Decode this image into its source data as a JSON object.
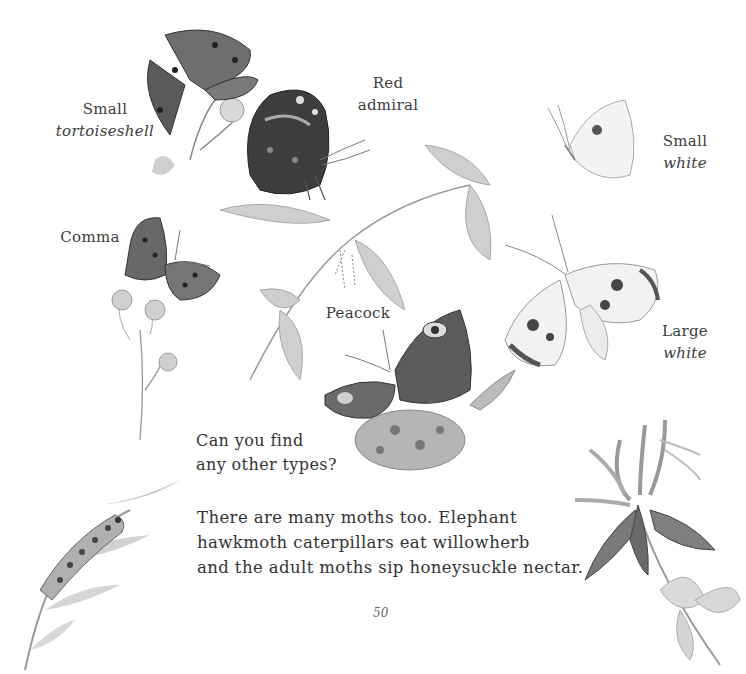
{
  "page": {
    "number": "50",
    "background": "#ffffff",
    "ink_color": "#3a3a3a"
  },
  "labels": {
    "small_tortoiseshell": {
      "line1": "Small",
      "line2": "tortoiseshell"
    },
    "red_admiral": {
      "line1": "Red",
      "line2": "admiral"
    },
    "small_white": {
      "line1": "Small",
      "line2": "white"
    },
    "comma": {
      "line1": "Comma"
    },
    "peacock": {
      "line1": "Peacock"
    },
    "large_white": {
      "line1": "Large",
      "line2": "white"
    }
  },
  "question": {
    "line1": "Can you find",
    "line2": "any other types?"
  },
  "paragraph": {
    "line1": "There are many moths too. Elephant",
    "line2": "hawkmoth caterpillars eat willowherb",
    "line3": "and the adult moths sip honeysuckle nectar."
  },
  "illustrations": [
    {
      "name": "small-tortoiseshell-butterfly-icon",
      "subject": "Small tortoiseshell on flower"
    },
    {
      "name": "red-admiral-butterfly-icon",
      "subject": "Red admiral on nettle"
    },
    {
      "name": "small-white-butterfly-icon",
      "subject": "Small white"
    },
    {
      "name": "comma-butterfly-icon",
      "subject": "Comma on knapweed"
    },
    {
      "name": "nettle-plant-icon",
      "subject": "Stinging nettle"
    },
    {
      "name": "peacock-butterfly-icon",
      "subject": "Peacock on flower head"
    },
    {
      "name": "large-white-butterfly-icon",
      "subject": "Large white"
    },
    {
      "name": "hawkmoth-caterpillar-icon",
      "subject": "Elephant hawkmoth caterpillar on willowherb"
    },
    {
      "name": "hawkmoth-honeysuckle-icon",
      "subject": "Elephant hawkmoth on honeysuckle"
    }
  ]
}
